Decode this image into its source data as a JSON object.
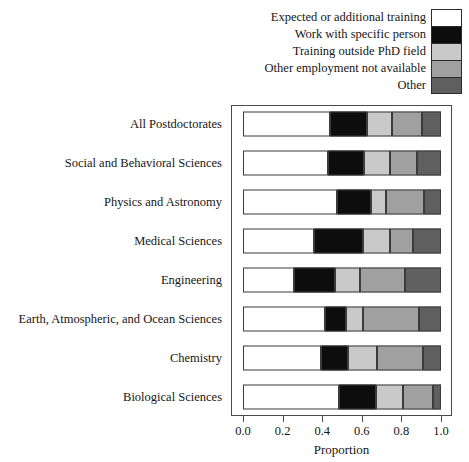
{
  "chart_data": {
    "type": "bar",
    "orientation": "horizontal",
    "stacked": true,
    "title": "",
    "xlabel": "Proportion",
    "ylabel": "",
    "xlim": [
      0.0,
      1.0
    ],
    "xticks": [
      "0.0",
      "0.2",
      "0.4",
      "0.6",
      "0.8",
      "1.0"
    ],
    "xtickvalues": [
      0.0,
      0.2,
      0.4,
      0.6,
      0.8,
      1.0
    ],
    "grid": false,
    "legend_position": "top-right",
    "categories": [
      "All Postdoctorates",
      "Social and Behavioral Sciences",
      "Physics and Astronomy",
      "Medical Sciences",
      "Engineering",
      "Earth, Atmospheric, and Ocean Sciences",
      "Chemistry",
      "Biological Sciences"
    ],
    "series": [
      {
        "name": "Expected or additional training",
        "color": "#ffffff",
        "values": [
          0.44,
          0.43,
          0.475,
          0.36,
          0.258,
          0.414,
          0.394,
          0.485
        ]
      },
      {
        "name": "Work with specific person",
        "color": "#0d0d0d",
        "values": [
          0.186,
          0.18,
          0.17,
          0.246,
          0.207,
          0.106,
          0.136,
          0.187
        ]
      },
      {
        "name": "Training outside PhD field",
        "color": "#c9c9c9",
        "values": [
          0.127,
          0.13,
          0.075,
          0.134,
          0.125,
          0.086,
          0.147,
          0.136
        ]
      },
      {
        "name": "Other employment not available",
        "color": "#a0a0a0",
        "values": [
          0.151,
          0.14,
          0.195,
          0.12,
          0.228,
          0.284,
          0.233,
          0.152
        ]
      },
      {
        "name": "Other",
        "color": "#5f5f5f",
        "values": [
          0.096,
          0.12,
          0.085,
          0.14,
          0.182,
          0.11,
          0.09,
          0.04
        ]
      }
    ]
  },
  "legend": {
    "items": [
      {
        "label": "Expected or additional training",
        "color": "#ffffff"
      },
      {
        "label": "Work with specific person",
        "color": "#0d0d0d"
      },
      {
        "label": "Training outside PhD field",
        "color": "#c9c9c9"
      },
      {
        "label": "Other employment not available",
        "color": "#a0a0a0"
      },
      {
        "label": "Other",
        "color": "#5f5f5f"
      }
    ]
  },
  "axis": {
    "x_title": "Proportion"
  }
}
